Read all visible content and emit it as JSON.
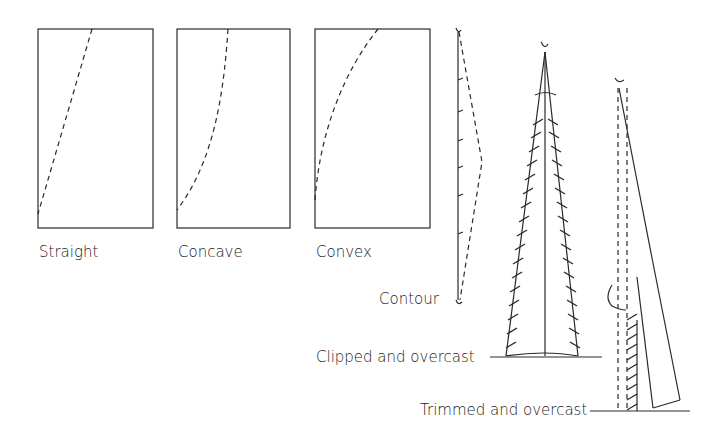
{
  "figure": {
    "background": "#ffffff",
    "ink_color": "#2a2a2a",
    "panels": [
      {
        "id": "straight",
        "label": "Straight"
      },
      {
        "id": "concave",
        "label": "Concave"
      },
      {
        "id": "convex",
        "label": "Convex"
      }
    ],
    "contour": {
      "label": "Contour"
    },
    "clipped": {
      "label": "Clipped and overcast"
    },
    "trimmed": {
      "label": "Trimmed and overcast"
    }
  }
}
